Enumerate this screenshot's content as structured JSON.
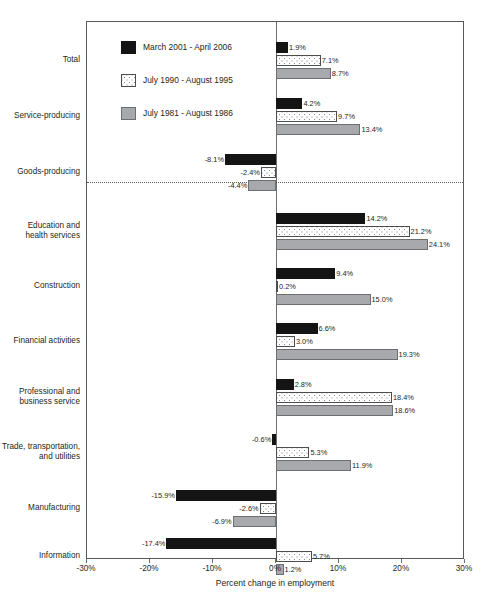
{
  "chart_data": {
    "type": "bar",
    "orientation": "horizontal",
    "title": "",
    "subtitle": "",
    "xlabel": "Percent change in employment",
    "ylabel": "",
    "xlim": [
      -30,
      30
    ],
    "xticks": [
      -30,
      -20,
      -10,
      0,
      10,
      20,
      30
    ],
    "xtick_labels": [
      "-30%",
      "-20%",
      "-10%",
      "0%",
      "10%",
      "20%",
      "30%"
    ],
    "grid": false,
    "legend_position": "upper-left-inside",
    "zero_line": true,
    "section_divider_after_category_index": 2,
    "categories": [
      "Total",
      "Service-producing",
      "Goods-producing",
      "Education and\nhealth services",
      "Construction",
      "Financial activities",
      "Professional and\nbusiness service",
      "Trade, transportation,\nand utilities",
      "Manufacturing",
      "Information"
    ],
    "series": [
      {
        "name": "March 2001 - April 2006",
        "style": "solid-black",
        "color": "#141414",
        "values": [
          1.9,
          4.2,
          -8.1,
          14.2,
          9.4,
          6.6,
          2.8,
          -0.6,
          -15.9,
          -17.4
        ],
        "labels": [
          "1.9%",
          "4.2%",
          "-8.1%",
          "14.2%",
          "9.4%",
          "6.6%",
          "2.8%",
          "-0.6%",
          "-15.9%",
          "-17.4%"
        ]
      },
      {
        "name": "July 1990 - August 1995",
        "style": "white-dotted",
        "color": "#ffffff",
        "values": [
          7.1,
          9.7,
          -2.4,
          21.2,
          0.2,
          3.0,
          18.4,
          5.3,
          -2.6,
          5.7
        ],
        "labels": [
          "7.1%",
          "9.7%",
          "-2.4%",
          "21.2%",
          "0.2%",
          "3.0%",
          "18.4%",
          "5.3%",
          "-2.6%",
          "5.7%"
        ]
      },
      {
        "name": "July 1981 - August 1986",
        "style": "solid-gray",
        "color": "#a7a9ac",
        "values": [
          8.7,
          13.4,
          -4.4,
          24.1,
          15.0,
          19.3,
          18.6,
          11.9,
          -6.9,
          1.2
        ],
        "labels": [
          "8.7%",
          "13.4%",
          "-4.4%",
          "24.1%",
          "15.0%",
          "19.3%",
          "18.6%",
          "11.9%",
          "-6.9%",
          "1.2%"
        ]
      }
    ]
  }
}
